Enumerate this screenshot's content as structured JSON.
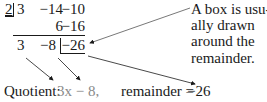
{
  "division": {
    "divisor": "2",
    "row1": [
      "3",
      "−14",
      "−10"
    ],
    "row2": [
      "6",
      "−16"
    ],
    "row3": [
      "3",
      "−8",
      "−26"
    ]
  },
  "note": {
    "line1": "A box is usu-",
    "line2": "ally drawn",
    "line3": "around the",
    "line4": "remainder."
  },
  "quotient": {
    "label": "Quotient:",
    "value": "3x − 8,"
  },
  "remainder": {
    "label": "remainder = ",
    "value": "−26"
  }
}
